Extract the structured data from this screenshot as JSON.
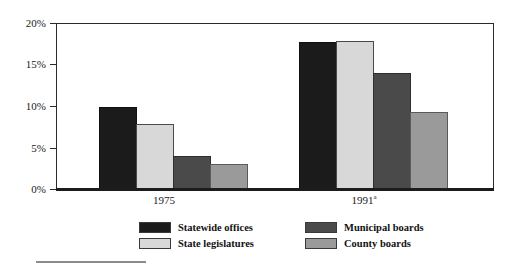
{
  "chart_data": {
    "type": "bar",
    "title": "",
    "subtitle": "",
    "xlabel": "",
    "ylabel": "",
    "categories": [
      "1975",
      "1991"
    ],
    "category_labels": [
      {
        "text": "1975",
        "superscript": ""
      },
      {
        "text": "1991",
        "superscript": "a"
      }
    ],
    "series": [
      {
        "name": "Statewide offices",
        "values": [
          10.0,
          17.8
        ],
        "color": "#1b1b1b"
      },
      {
        "name": "State legislatures",
        "values": [
          7.9,
          17.9
        ],
        "color": "#d8d8d8"
      },
      {
        "name": "Municipal boards",
        "values": [
          4.0,
          14.1
        ],
        "color": "#4a4a4a"
      },
      {
        "name": "County boards",
        "values": [
          3.0,
          9.3
        ],
        "color": "#9a9a9a"
      }
    ],
    "ylim": [
      0,
      20
    ],
    "ytick_values": [
      0,
      5,
      10,
      15,
      20
    ],
    "ytick_labels": [
      "0%",
      "5%",
      "10%",
      "15%",
      "20%"
    ],
    "grid": false,
    "legend_position": "bottom",
    "value_format": "percent"
  },
  "axes": {
    "y": {
      "ticks": [
        {
          "label": "20%",
          "value": 20
        },
        {
          "label": "15%",
          "value": 15
        },
        {
          "label": "10%",
          "value": 10
        },
        {
          "label": "5%",
          "value": 5
        },
        {
          "label": "0%",
          "value": 0
        }
      ]
    },
    "x": {
      "ticks": [
        {
          "label": "1975",
          "superscript": ""
        },
        {
          "label": "1991",
          "superscript": "a"
        }
      ]
    }
  },
  "legend": {
    "items": [
      {
        "label": "Statewide offices",
        "swatch": "swatch-statewide"
      },
      {
        "label": "State legislatures",
        "swatch": "swatch-legislatures"
      },
      {
        "label": "Municipal boards",
        "swatch": "swatch-municipal"
      },
      {
        "label": "County boards",
        "swatch": "swatch-county"
      }
    ]
  },
  "colors": {
    "statewide_offices": "#1b1b1b",
    "state_legislatures": "#d8d8d8",
    "municipal_boards": "#4a4a4a",
    "county_boards": "#9a9a9a",
    "axis": "#1c1c1c",
    "background": "#ffffff"
  }
}
